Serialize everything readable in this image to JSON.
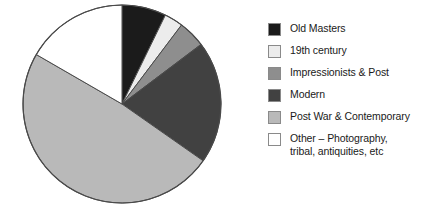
{
  "chart_data": {
    "type": "pie",
    "title": "",
    "subtitle": "",
    "xlabel": "",
    "ylabel": "",
    "legend_position": "right",
    "grid": false,
    "categories": [
      "Old Masters",
      "19th century",
      "Impressionists & Post",
      "Modern",
      "Post War & Contemporary",
      "Other – Photography,\ntribal, antiquities, etc"
    ],
    "values": [
      7.2,
      3.1,
      4.4,
      20.0,
      48.6,
      16.7
    ],
    "unit": "%",
    "slice_start_angles_deg": [
      0,
      26,
      37,
      53,
      125,
      300
    ],
    "slice_end_angles_deg": [
      26,
      37,
      53,
      125,
      300,
      360
    ],
    "colors": [
      "#1b1b1b",
      "#ececec",
      "#8e8e8e",
      "#414141",
      "#b9b9b9",
      "#ffffff"
    ],
    "series": [
      {
        "name": "Share of market",
        "values": [
          7.2,
          3.1,
          4.4,
          20.0,
          48.6,
          16.7
        ]
      }
    ]
  },
  "legend": {
    "items": [
      {
        "label": "Old Masters",
        "color": "#1b1b1b"
      },
      {
        "label": "19th century",
        "color": "#ececec"
      },
      {
        "label": "Impressionists & Post",
        "color": "#8e8e8e"
      },
      {
        "label": "Modern",
        "color": "#414141"
      },
      {
        "label": "Post War & Contemporary",
        "color": "#b9b9b9"
      },
      {
        "label": "Other – Photography,\ntribal, antiquities, etc",
        "color": "#ffffff"
      }
    ]
  },
  "pie": {
    "center_x": 122,
    "center_y": 104,
    "radius": 99,
    "outline_color": "#4a4a4a"
  }
}
